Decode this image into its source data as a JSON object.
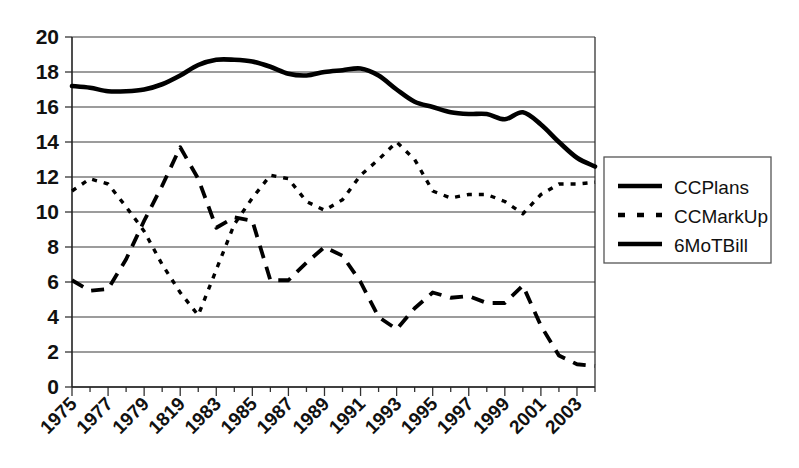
{
  "chart_data": {
    "type": "line",
    "title": "",
    "subtitle": "",
    "xlabel": "",
    "ylabel": "",
    "xlim": [
      1975,
      2004
    ],
    "ylim": [
      0,
      20
    ],
    "ytick_values": [
      0,
      2,
      4,
      6,
      8,
      10,
      12,
      14,
      16,
      18,
      20
    ],
    "ytick_labels": [
      "0",
      "2",
      "4",
      "6",
      "8",
      "10",
      "12",
      "14",
      "16",
      "18",
      "20"
    ],
    "xtick_labels": [
      "1975",
      "1977",
      "1979",
      "1819",
      "1983",
      "1985",
      "1987",
      "1989",
      "1991",
      "1993",
      "1995",
      "1997",
      "1999",
      "2001",
      "2003"
    ],
    "xtick_years": [
      1975,
      1977,
      1979,
      1981,
      1983,
      1985,
      1987,
      1989,
      1991,
      1993,
      1995,
      1997,
      1999,
      2001,
      2003
    ],
    "xtick_rotation_deg": -45,
    "grid": "horizontal",
    "legend_position": "right",
    "x": [
      1975,
      1976,
      1977,
      1978,
      1979,
      1980,
      1981,
      1982,
      1983,
      1984,
      1985,
      1986,
      1987,
      1988,
      1989,
      1990,
      1991,
      1992,
      1993,
      1994,
      1995,
      1996,
      1997,
      1998,
      1999,
      2000,
      2001,
      2002,
      2003,
      2004
    ],
    "series": [
      {
        "name": "CCPlans",
        "style": "solid-thick",
        "color": "#000000",
        "values": [
          17.2,
          17.1,
          16.9,
          16.9,
          17.0,
          17.3,
          17.8,
          18.4,
          18.7,
          18.7,
          18.6,
          18.3,
          17.9,
          17.8,
          18.0,
          18.1,
          18.2,
          17.8,
          17.0,
          16.3,
          16.0,
          15.7,
          15.6,
          15.6,
          15.3,
          15.7,
          15.0,
          14.0,
          13.1,
          12.6
        ]
      },
      {
        "name": "CCMarkUp",
        "style": "dotted",
        "color": "#000000",
        "values": [
          11.2,
          11.9,
          11.6,
          10.3,
          8.9,
          7.0,
          5.4,
          4.1,
          6.7,
          9.3,
          10.8,
          12.1,
          11.9,
          10.6,
          10.1,
          10.7,
          12.1,
          13.0,
          14.0,
          13.0,
          11.2,
          10.8,
          11.0,
          11.0,
          10.6,
          9.9,
          11.0,
          11.6,
          11.6,
          11.7
        ]
      },
      {
        "name": "6MoTBill",
        "style": "dashed",
        "color": "#000000",
        "values": [
          6.1,
          5.5,
          5.6,
          7.3,
          9.5,
          11.5,
          13.7,
          11.9,
          9.1,
          9.7,
          9.5,
          6.1,
          6.1,
          7.1,
          8.0,
          7.5,
          6.0,
          4.0,
          3.3,
          4.5,
          5.4,
          5.1,
          5.2,
          4.8,
          4.8,
          5.8,
          3.5,
          1.8,
          1.3,
          1.2
        ]
      }
    ],
    "legend": [
      {
        "label": "CCPlans",
        "style": "solid-thick"
      },
      {
        "label": "CCMarkUp",
        "style": "dotted"
      },
      {
        "label": "6MoTBill",
        "style": "dashed"
      }
    ]
  }
}
